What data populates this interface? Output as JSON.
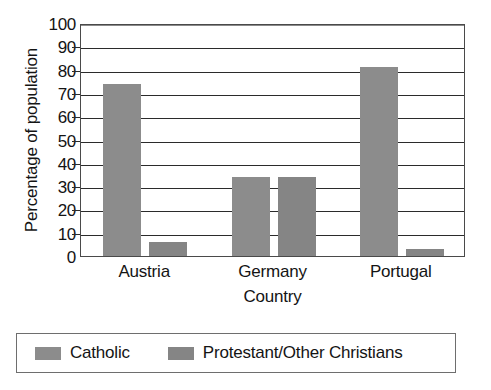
{
  "chart_data": {
    "type": "bar",
    "title": "",
    "xlabel": "Country",
    "ylabel": "Percentage of population",
    "categories": [
      "Austria",
      "Germany",
      "Portugal"
    ],
    "series": [
      {
        "name": "Catholic",
        "values": [
          74,
          34,
          81
        ],
        "color": "#8c8c8c"
      },
      {
        "name": "Protestant/Other Christians",
        "values": [
          6,
          34,
          3
        ],
        "color": "#858585"
      }
    ],
    "ylim": [
      0,
      100
    ],
    "ytick_step": 10,
    "yticks": [
      100,
      90,
      80,
      70,
      60,
      50,
      40,
      30,
      20,
      10,
      0
    ],
    "ytick_labels": [
      "100",
      "90",
      "80",
      "70",
      "60",
      "50",
      "40",
      "30",
      "20",
      "10",
      "0"
    ],
    "grid": true,
    "grid_axis": "y",
    "legend_position": "bottom"
  },
  "axes": {
    "y_title": "Percentage of population",
    "x_title": "Country"
  },
  "legend": {
    "items": [
      {
        "label": "Catholic"
      },
      {
        "label": "Protestant/Other Christians"
      }
    ]
  }
}
